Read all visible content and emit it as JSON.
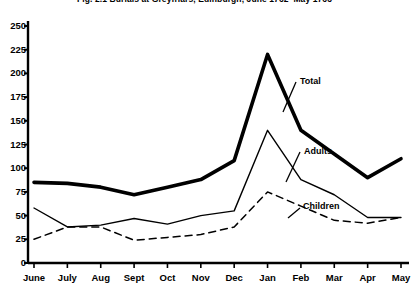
{
  "chart_data": {
    "type": "line",
    "title": "Fig. 2.1  Burials at Greyfriars, Edinburgh, June 1762–May 1763",
    "xlabel": "",
    "ylabel": "",
    "categories": [
      "June",
      "July",
      "Aug",
      "Sept",
      "Oct",
      "Nov",
      "Dec",
      "Jan",
      "Feb",
      "Mar",
      "Apr",
      "May"
    ],
    "ylim": [
      0,
      250
    ],
    "ytick_labels": [
      "0",
      "25",
      "50",
      "75",
      "100",
      "125",
      "150",
      "175",
      "200",
      "225",
      "250"
    ],
    "ytick_values": [
      0,
      25,
      50,
      75,
      100,
      125,
      150,
      175,
      200,
      225,
      250
    ],
    "grid": false,
    "legend": "inline-annotations",
    "series": [
      {
        "name": "Total",
        "style": "solid-thick",
        "color": "#000000",
        "label_position": "inline",
        "values": [
          85,
          84,
          80,
          72,
          80,
          88,
          108,
          220,
          140,
          115,
          90,
          110
        ]
      },
      {
        "name": "Adults",
        "style": "solid-thin",
        "color": "#000000",
        "label_position": "inline",
        "values": [
          58,
          38,
          40,
          47,
          41,
          50,
          55,
          140,
          88,
          72,
          48,
          48
        ]
      },
      {
        "name": "Children",
        "style": "dashed",
        "color": "#000000",
        "label_position": "inline",
        "values": [
          25,
          38,
          38,
          24,
          27,
          30,
          38,
          75,
          60,
          45,
          42,
          48
        ]
      }
    ]
  },
  "axis": {
    "y_tick_mark": "tick",
    "x_tick_mark": "tick"
  }
}
